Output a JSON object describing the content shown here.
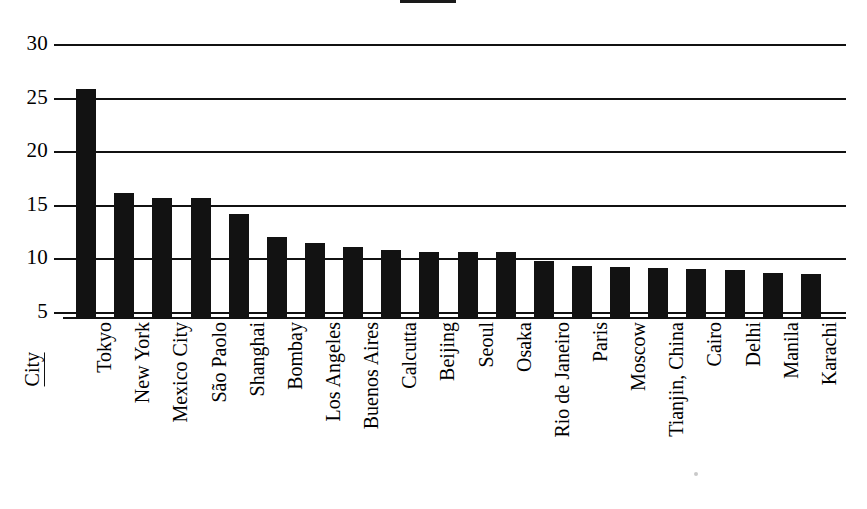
{
  "title": {
    "text": "",
    "underlined": true,
    "note": "title cropped off top of screenshot; only its underline rule is visible"
  },
  "axis_title": {
    "label": "City",
    "underlined": true
  },
  "colors": {
    "bar_fill": "#121212",
    "gridline": "#111111",
    "background": "#ffffff",
    "text": "#000000"
  },
  "chart_data": {
    "type": "bar",
    "title": "",
    "xlabel": "City",
    "ylabel": "",
    "ylim": [
      5,
      30
    ],
    "yticks": [
      5,
      10,
      15,
      20,
      25,
      30
    ],
    "ytick_labels": [
      "5",
      "10",
      "15",
      "20",
      "25",
      "30"
    ],
    "grid": true,
    "legend": "none",
    "orientation": "vertical",
    "xtick_rotation": 90,
    "categories": [
      "Tokyo",
      "New York",
      "Mexico City",
      "São Paolo",
      "Shanghai",
      "Bombay",
      "Los Angeles",
      "Buenos Aires",
      "Calcutta",
      "Beijing",
      "Seoul",
      "Osaka",
      "Rio de Janeiro",
      "Paris",
      "Moscow",
      "Tianjin, China",
      "Cairo",
      "Delhi",
      "Manila",
      "Karachi"
    ],
    "values": [
      25.8,
      16.1,
      15.6,
      15.6,
      14.1,
      12.0,
      11.4,
      11.1,
      10.8,
      10.6,
      10.6,
      10.6,
      9.8,
      9.3,
      9.2,
      9.1,
      9.0,
      8.9,
      8.6,
      8.5
    ]
  }
}
